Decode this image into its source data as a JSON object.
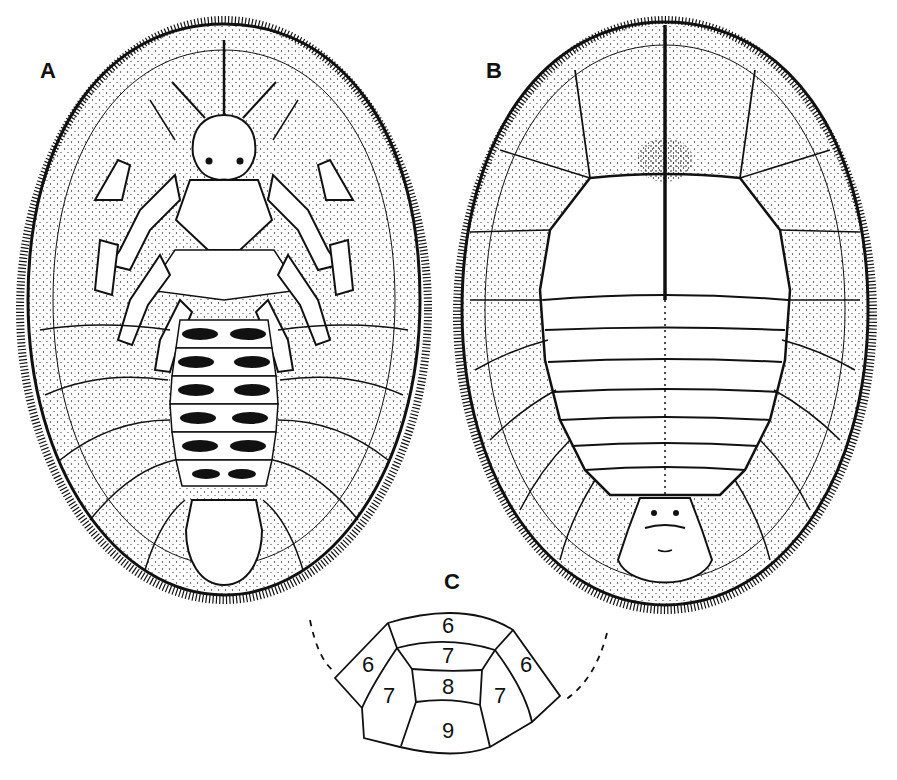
{
  "figure": {
    "panels": [
      {
        "id": "A",
        "label": "A",
        "view": "ventral view of larva (legs, head, mouthparts, abdominal segments)"
      },
      {
        "id": "B",
        "label": "B",
        "view": "dorsal view of larva (midline suture, thoracic and abdominal tergites, pygidium)"
      },
      {
        "id": "C",
        "label": "C",
        "view": "diagram of terminal abdominal segments with numbering"
      }
    ],
    "segment_diagram": {
      "labels": [
        {
          "pos": "top-center",
          "value": "6"
        },
        {
          "pos": "left-outer",
          "value": "6"
        },
        {
          "pos": "right-outer",
          "value": "6"
        },
        {
          "pos": "center-upper",
          "value": "7"
        },
        {
          "pos": "left-inner",
          "value": "7"
        },
        {
          "pos": "right-inner",
          "value": "7"
        },
        {
          "pos": "center-middle",
          "value": "8"
        },
        {
          "pos": "center-bottom",
          "value": "9"
        }
      ]
    },
    "colors": {
      "ink": "#111111",
      "paper": "#ffffff"
    }
  }
}
